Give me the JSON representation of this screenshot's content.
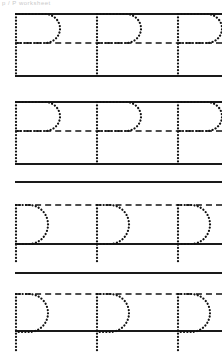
{
  "worksheet": {
    "title": "Letter P Handwriting Tracing Practice Worksheet",
    "artifact_text": "p / P  worksheet",
    "canvas": {
      "width": 222,
      "height": 358,
      "background": "#ffffff"
    },
    "colors": {
      "rule_solid": "#1a1a1a",
      "rule_dashed": "#4d4d4d",
      "trace_dots": "#111111",
      "page_background": "#ffffff"
    },
    "letter": "P",
    "letter_lowercase": "p",
    "letters_per_row": 3,
    "row_count": 4,
    "rows": [
      {
        "index": 1,
        "name": "row-uppercase-p-1",
        "letter_form": "uppercase",
        "letter_label": "P",
        "guide_lines": [
          {
            "name": "top-line",
            "style": "solid",
            "y": 13
          },
          {
            "name": "mid-line",
            "style": "dashed",
            "y": 42
          },
          {
            "name": "base-line",
            "style": "solid",
            "y": 75
          }
        ],
        "letter_x_positions": [
          15,
          96,
          177
        ]
      },
      {
        "index": 2,
        "name": "row-uppercase-p-2",
        "letter_form": "uppercase",
        "letter_label": "P",
        "guide_lines": [
          {
            "name": "top-line",
            "style": "solid",
            "y": 101
          },
          {
            "name": "mid-line",
            "style": "dashed",
            "y": 130
          },
          {
            "name": "base-line",
            "style": "solid",
            "y": 163
          }
        ],
        "letter_x_positions": [
          15,
          96,
          177
        ]
      },
      {
        "index": 3,
        "name": "row-lowercase-p-1",
        "letter_form": "lowercase",
        "letter_label": "p",
        "guide_lines": [
          {
            "name": "top-line",
            "style": "solid",
            "y": 181
          },
          {
            "name": "mid-line",
            "style": "dashed",
            "y": 204
          },
          {
            "name": "base-line",
            "style": "solid",
            "y": 243
          }
        ],
        "letter_x_positions": [
          15,
          96,
          177
        ]
      },
      {
        "index": 4,
        "name": "row-lowercase-p-2",
        "letter_form": "lowercase",
        "letter_label": "p",
        "guide_lines": [
          {
            "name": "top-line",
            "style": "solid",
            "y": 272
          },
          {
            "name": "mid-line",
            "style": "dashed",
            "y": 293
          },
          {
            "name": "base-line",
            "style": "solid",
            "y": 330
          }
        ],
        "letter_x_positions": [
          15,
          96,
          177
        ]
      }
    ]
  }
}
